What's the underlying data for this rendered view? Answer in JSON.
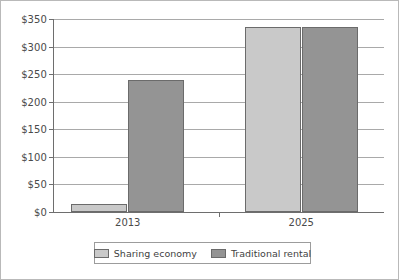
{
  "chart_data": {
    "type": "bar",
    "title": "",
    "subtitle": "",
    "xlabel": "",
    "ylabel": "",
    "categories": [
      "2013",
      "2025"
    ],
    "series": [
      {
        "name": "Sharing economy",
        "color": "#c9c9c9",
        "values": [
          15,
          335
        ]
      },
      {
        "name": "Traditional rental",
        "color": "#949494",
        "values": [
          240,
          335
        ]
      }
    ],
    "ylim": [
      0,
      350
    ],
    "ytick_values": [
      0,
      50,
      100,
      150,
      200,
      250,
      300,
      350
    ],
    "ytick_labels": [
      "$0",
      "$50",
      "$100",
      "$150",
      "$200",
      "$250",
      "$300",
      "$350"
    ],
    "grid": true,
    "grid_axis": "y",
    "legend": true,
    "legend_position": "bottom",
    "annotations": []
  },
  "figure": {
    "background_color": "#ffffff",
    "border_color": "#b9b9b9",
    "axis_color": "#6e6e6e",
    "gridline_color": "#a9a9a9",
    "bar_edge_color": "#6b6b6b",
    "text_color": "#4a4a4a"
  }
}
